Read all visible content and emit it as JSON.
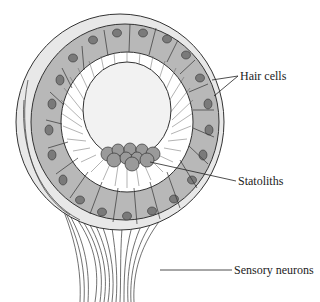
{
  "diagram": {
    "colors": {
      "background": "#ffffff",
      "cell_fill": "#b8b8b8",
      "nucleus_fill": "#7a7a7a",
      "outline": "#333333",
      "lumen_fill": "#f4f4f4",
      "statolith_fill": "#9a9a9a",
      "label_text": "#222222"
    },
    "labels": [
      {
        "id": "hair-cells",
        "text": "Hair cells"
      },
      {
        "id": "statoliths",
        "text": "Statoliths"
      },
      {
        "id": "sensory-neurons",
        "text": "Sensory neurons"
      }
    ]
  }
}
